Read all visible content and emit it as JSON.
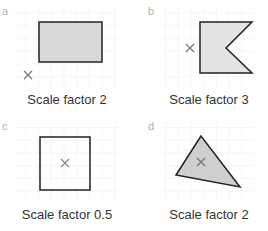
{
  "panels": [
    {
      "letter": "a",
      "caption": "Scale factor 2",
      "shape": "rectangle",
      "centre": "outside, bottom-left"
    },
    {
      "letter": "b",
      "caption": "Scale factor 3",
      "shape": "flag pentagon",
      "centre": "outside, left"
    },
    {
      "letter": "c",
      "caption": "Scale factor 0.5",
      "shape": "square",
      "centre": "inside, centre"
    },
    {
      "letter": "d",
      "caption": "Scale factor 2",
      "shape": "triangle",
      "centre": "inside"
    }
  ],
  "colors": {
    "grid": "#e6e6e6",
    "fill": "#d9d9d9",
    "stroke": "#222222",
    "cross": "#777777",
    "letter": "#b0b0b0"
  }
}
